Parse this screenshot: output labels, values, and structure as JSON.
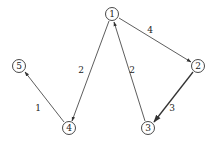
{
  "graph": {
    "type": "directed-weighted",
    "nodes": [
      {
        "id": "1",
        "label": "1",
        "x": 112,
        "y": 14
      },
      {
        "id": "2",
        "label": "2",
        "x": 198,
        "y": 66
      },
      {
        "id": "3",
        "label": "3",
        "x": 148,
        "y": 128
      },
      {
        "id": "4",
        "label": "4",
        "x": 69,
        "y": 128
      },
      {
        "id": "5",
        "label": "5",
        "x": 19,
        "y": 66
      }
    ],
    "edges": [
      {
        "from": "1",
        "to": "2",
        "weight": "4",
        "label_x": 150,
        "label_y": 30
      },
      {
        "from": "1",
        "to": "4",
        "weight": "2",
        "label_x": 81,
        "label_y": 70
      },
      {
        "from": "3",
        "to": "1",
        "weight": "2",
        "label_x": 132,
        "label_y": 70
      },
      {
        "from": "2",
        "to": "3",
        "weight": "3",
        "label_x": 172,
        "label_y": 108
      },
      {
        "from": "4",
        "to": "5",
        "weight": "1",
        "label_x": 38,
        "label_y": 108
      }
    ]
  },
  "style": {
    "line_color": "#333333",
    "background": "#ffffff"
  }
}
